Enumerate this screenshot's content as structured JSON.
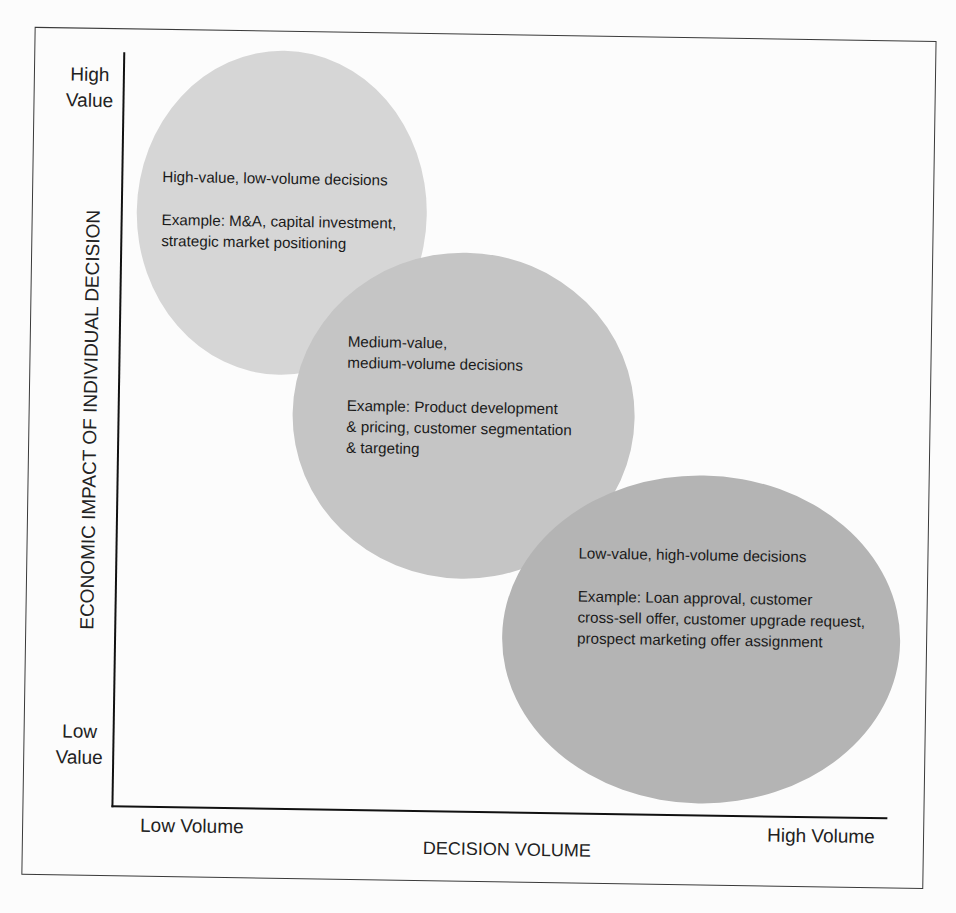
{
  "figure": {
    "y_axis": {
      "title": "ECONOMIC IMPACT OF INDIVIDUAL DECISION",
      "high_label": [
        "High",
        "Value"
      ],
      "low_label": [
        "Low",
        "Value"
      ]
    },
    "x_axis": {
      "title": "DECISION VOLUME",
      "low_label": "Low Volume",
      "high_label": "High Volume"
    },
    "clusters": [
      {
        "title_lines": [
          "High-value, low-volume decisions"
        ],
        "example_lines": [
          "Example: M&A, capital investment,",
          "strategic market positioning"
        ],
        "fill": "#d6d6d6"
      },
      {
        "title_lines": [
          "Medium-value,",
          "medium-volume decisions"
        ],
        "example_lines": [
          "Example: Product development",
          "& pricing, customer segmentation",
          "& targeting"
        ],
        "fill": "#c5c5c5"
      },
      {
        "title_lines": [
          "Low-value, high-volume decisions"
        ],
        "example_lines": [
          "Example: Loan approval, customer",
          "cross-sell offer, customer upgrade request,",
          "prospect marketing offer assignment"
        ],
        "fill": "#b4b4b4"
      }
    ]
  },
  "colors": {
    "background": "#fcfcfc",
    "frame": "#3a3a3a",
    "axis": "#111111",
    "text": "#1c1c1c"
  }
}
